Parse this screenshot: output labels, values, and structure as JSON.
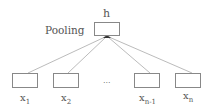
{
  "diagram": {
    "type": "pooling-network",
    "output_node": {
      "label": "h"
    },
    "operation_label": "Pooling",
    "input_nodes": [
      {
        "label": "x",
        "subscript": "1"
      },
      {
        "label": "x",
        "subscript": "2"
      },
      {
        "label": "x",
        "subscript": "n-1"
      },
      {
        "label": "x",
        "subscript": "n"
      }
    ],
    "ellipsis": "...",
    "colors": {
      "box_border": "#888888",
      "edge": "#aaaaaa",
      "text": "#555555",
      "arrow": "#333333"
    }
  }
}
